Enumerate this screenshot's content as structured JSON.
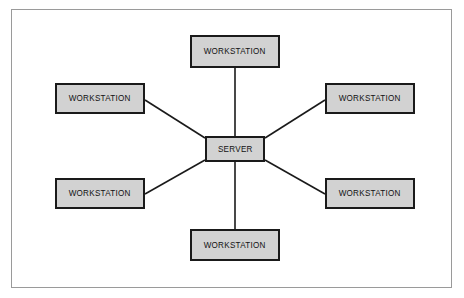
{
  "diagram": {
    "background_color": "#ffffff",
    "frame": {
      "border_color": "#9a9a9a",
      "x": 11,
      "y": 9,
      "width": 441,
      "height": 279
    },
    "style": {
      "node_fill": "#d2d2d2",
      "node_border": "#1a1a1a",
      "link_color": "#1a1a1a",
      "text_color": "#111111"
    },
    "nodes": [
      {
        "id": "workstation-top",
        "label": "WORKSTATION",
        "x": 190,
        "y": 35,
        "width": 90,
        "height": 33
      },
      {
        "id": "workstation-top-left",
        "label": "WORKSTATION",
        "x": 55,
        "y": 83,
        "width": 90,
        "height": 31
      },
      {
        "id": "workstation-top-right",
        "label": "WORKSTATION",
        "x": 325,
        "y": 83,
        "width": 90,
        "height": 31
      },
      {
        "id": "server",
        "label": "SERVER",
        "x": 205,
        "y": 136,
        "width": 60,
        "height": 26
      },
      {
        "id": "workstation-bottom-left",
        "label": "WORKSTATION",
        "x": 55,
        "y": 178,
        "width": 90,
        "height": 31
      },
      {
        "id": "workstation-bottom-right",
        "label": "WORKSTATION",
        "x": 325,
        "y": 178,
        "width": 90,
        "height": 31
      },
      {
        "id": "workstation-bottom",
        "label": "WORKSTATION",
        "x": 190,
        "y": 229,
        "width": 90,
        "height": 32
      }
    ],
    "links": [
      {
        "id": "link-server-workstation-top",
        "from": "server",
        "to": "workstation-top",
        "x1": 235,
        "y1": 136,
        "x2": 235,
        "y2": 68
      },
      {
        "id": "link-server-workstation-top-left",
        "from": "server",
        "to": "workstation-top-left",
        "x1": 205,
        "y1": 138,
        "x2": 145,
        "y2": 100
      },
      {
        "id": "link-server-workstation-top-right",
        "from": "server",
        "to": "workstation-top-right",
        "x1": 265,
        "y1": 138,
        "x2": 325,
        "y2": 100
      },
      {
        "id": "link-server-workstation-bottom-left",
        "from": "server",
        "to": "workstation-bottom-left",
        "x1": 205,
        "y1": 160,
        "x2": 145,
        "y2": 194
      },
      {
        "id": "link-server-workstation-bottom-right",
        "from": "server",
        "to": "workstation-bottom-right",
        "x1": 265,
        "y1": 160,
        "x2": 325,
        "y2": 194
      },
      {
        "id": "link-server-workstation-bottom",
        "from": "server",
        "to": "workstation-bottom",
        "x1": 235,
        "y1": 162,
        "x2": 235,
        "y2": 229
      }
    ]
  }
}
